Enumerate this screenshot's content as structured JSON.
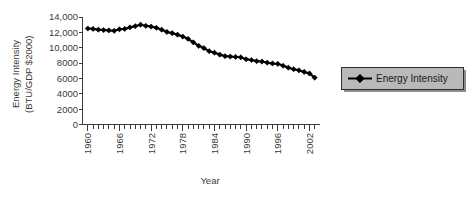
{
  "chart_data": {
    "type": "line",
    "title": "",
    "subtitle": "",
    "xlabel": "Year",
    "ylabel_line1": "Energy Intensity",
    "ylabel_line2": "(BTU/GDP $2000)",
    "grid": false,
    "legend_position": "right",
    "xlim": [
      1959,
      2004
    ],
    "ylim": [
      0,
      14000
    ],
    "ytick_labels": [
      "14,000",
      "12,000",
      "10,000",
      "8000",
      "6000",
      "4000",
      "2000",
      "0"
    ],
    "ytick_values": [
      14000,
      12000,
      10000,
      8000,
      6000,
      4000,
      2000,
      0
    ],
    "xtick_labels": [
      "1960",
      "1966",
      "1972",
      "1978",
      "1984",
      "1990",
      "1996",
      "2002"
    ],
    "xtick_values": [
      1960,
      1966,
      1972,
      1978,
      1984,
      1990,
      1996,
      2002
    ],
    "xtick_minor_step": 1,
    "series": [
      {
        "name": "Energy Intensity",
        "color": "#000000",
        "marker": "diamond",
        "x": [
          1960,
          1961,
          1962,
          1963,
          1964,
          1965,
          1966,
          1967,
          1968,
          1969,
          1970,
          1971,
          1972,
          1973,
          1974,
          1975,
          1976,
          1977,
          1978,
          1979,
          1980,
          1981,
          1982,
          1983,
          1984,
          1985,
          1986,
          1987,
          1988,
          1989,
          1990,
          1991,
          1992,
          1993,
          1994,
          1995,
          1996,
          1997,
          1998,
          1999,
          2000,
          2001,
          2002,
          2003
        ],
        "values": [
          12500,
          12450,
          12350,
          12300,
          12250,
          12200,
          12400,
          12450,
          12650,
          12800,
          13000,
          12850,
          12750,
          12600,
          12350,
          12050,
          11900,
          11700,
          11450,
          11150,
          10700,
          10250,
          9950,
          9550,
          9350,
          9100,
          8900,
          8850,
          8800,
          8750,
          8500,
          8400,
          8250,
          8200,
          8050,
          7950,
          7900,
          7650,
          7400,
          7200,
          7050,
          6850,
          6650,
          6100
        ]
      }
    ]
  },
  "legend": {
    "entries": [
      {
        "label": "Energy Intensity"
      }
    ]
  },
  "icons": {
    "legend_marker": "diamond-marker-icon"
  },
  "colors": {
    "series": "#000000",
    "legend_fill": "#b9b9b9",
    "legend_border": "#2e2e2e",
    "axis": "#3c3c3c",
    "text": "#3a3a3a"
  }
}
